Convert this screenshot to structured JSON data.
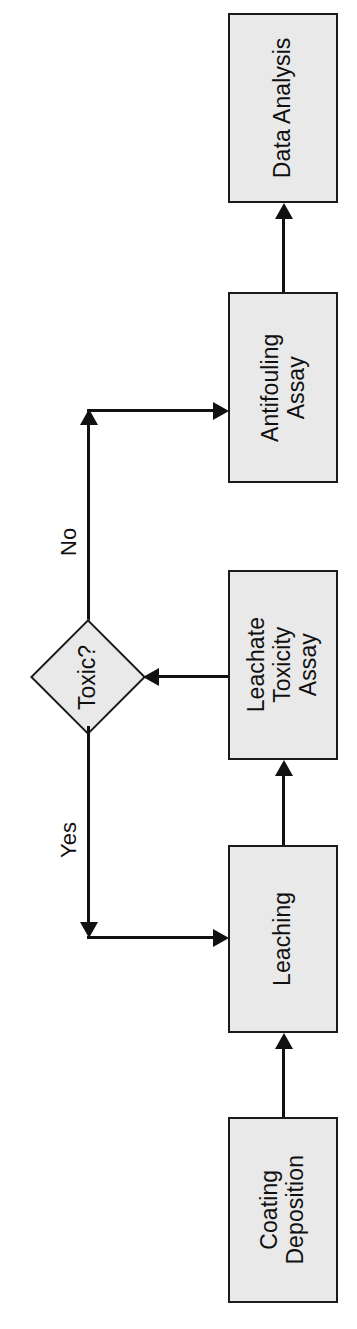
{
  "diagram": {
    "orientation": "rotated-90-ccw",
    "background_color": "#ffffff",
    "node_fill_color": "#e9e9e9",
    "node_border_color": "#1b1b1b",
    "connector_color": "#111111",
    "nodes": [
      {
        "id": "data-analysis",
        "shape": "process",
        "lines": [
          "Data Analysis"
        ],
        "text": "Data Analysis"
      },
      {
        "id": "antifouling-assay",
        "shape": "process",
        "lines": [
          "Antifouling",
          "Assay"
        ],
        "text": "Antifouling Assay"
      },
      {
        "id": "leachate-toxicity-assay",
        "shape": "process",
        "lines": [
          "Leachate",
          "Toxicity",
          "Assay"
        ],
        "text": "Leachate Toxicity Assay"
      },
      {
        "id": "leaching",
        "shape": "process",
        "lines": [
          "Leaching"
        ],
        "text": "Leaching"
      },
      {
        "id": "coating-deposition",
        "shape": "process",
        "lines": [
          "Coating",
          "Deposition"
        ],
        "text": "Coating Deposition"
      },
      {
        "id": "toxic-decision",
        "shape": "decision",
        "lines": [
          "Toxic?"
        ],
        "text": "Toxic?"
      }
    ],
    "edges": [
      {
        "id": "coating-to-leaching",
        "from": "coating-deposition",
        "to": "leaching",
        "label": ""
      },
      {
        "id": "leaching-to-leachate",
        "from": "leaching",
        "to": "leachate-toxicity-assay",
        "label": ""
      },
      {
        "id": "leachate-to-toxic",
        "from": "leachate-toxicity-assay",
        "to": "toxic-decision",
        "label": ""
      },
      {
        "id": "toxic-yes-to-leaching",
        "from": "toxic-decision",
        "to": "leaching",
        "label": "Yes"
      },
      {
        "id": "toxic-no-to-antifouling",
        "from": "toxic-decision",
        "to": "antifouling-assay",
        "label": "No"
      },
      {
        "id": "antifouling-to-data-analysis",
        "from": "antifouling-assay",
        "to": "data-analysis",
        "label": ""
      }
    ],
    "edge_labels": {
      "no": "No",
      "yes": "Yes"
    }
  }
}
